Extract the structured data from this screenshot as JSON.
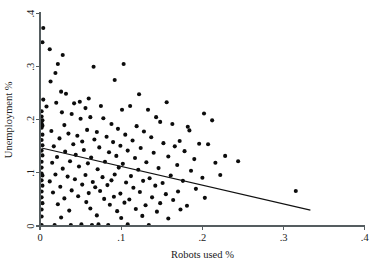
{
  "chart_data": {
    "type": "scatter",
    "title": "",
    "xlabel": "Robots used %",
    "ylabel": "Unemployment %",
    "xlim": [
      0,
      0.4
    ],
    "ylim": [
      0,
      0.4
    ],
    "xticks": [
      0,
      0.1,
      0.2,
      0.3,
      0.4
    ],
    "xticklabels": [
      "0",
      ".1",
      ".2",
      ".3",
      ".4"
    ],
    "yticks": [
      0,
      0.1,
      0.2,
      0.3,
      0.4
    ],
    "yticklabels": [
      "0",
      ".1",
      ".2",
      ".3",
      ".4"
    ],
    "grid": false,
    "legend": null,
    "marker": "filled-circle",
    "marker_color": "#0c0c0c",
    "fit_line": {
      "name": "linear fit",
      "color": "#111111",
      "x_start": 0.002,
      "y_start": 0.147,
      "x_end": 0.333,
      "y_end": 0.03
    },
    "points": [
      [
        0.004,
        0.373
      ],
      [
        0.003,
        0.346
      ],
      [
        0.012,
        0.333
      ],
      [
        0.028,
        0.322
      ],
      [
        0.022,
        0.305
      ],
      [
        0.019,
        0.288
      ],
      [
        0.066,
        0.3
      ],
      [
        0.103,
        0.305
      ],
      [
        0.013,
        0.272
      ],
      [
        0.092,
        0.275
      ],
      [
        0.026,
        0.253
      ],
      [
        0.032,
        0.249
      ],
      [
        0.122,
        0.248
      ],
      [
        0.004,
        0.238
      ],
      [
        0.049,
        0.234
      ],
      [
        0.06,
        0.24
      ],
      [
        0.02,
        0.232
      ],
      [
        0.042,
        0.231
      ],
      [
        0.111,
        0.226
      ],
      [
        0.156,
        0.233
      ],
      [
        0.008,
        0.225
      ],
      [
        0.056,
        0.222
      ],
      [
        0.075,
        0.226
      ],
      [
        0.101,
        0.219
      ],
      [
        0.133,
        0.219
      ],
      [
        0.002,
        0.216
      ],
      [
        0.027,
        0.214
      ],
      [
        0.039,
        0.211
      ],
      [
        0.002,
        0.206
      ],
      [
        0.003,
        0.199
      ],
      [
        0.05,
        0.202
      ],
      [
        0.062,
        0.205
      ],
      [
        0.078,
        0.203
      ],
      [
        0.143,
        0.205
      ],
      [
        0.002,
        0.193
      ],
      [
        0.003,
        0.189
      ],
      [
        0.002,
        0.185
      ],
      [
        0.03,
        0.19
      ],
      [
        0.088,
        0.192
      ],
      [
        0.119,
        0.188
      ],
      [
        0.148,
        0.196
      ],
      [
        0.163,
        0.192
      ],
      [
        0.014,
        0.179
      ],
      [
        0.058,
        0.181
      ],
      [
        0.07,
        0.177
      ],
      [
        0.096,
        0.183
      ],
      [
        0.128,
        0.178
      ],
      [
        0.182,
        0.187
      ],
      [
        0.184,
        0.18
      ],
      [
        0.003,
        0.172
      ],
      [
        0.035,
        0.174
      ],
      [
        0.046,
        0.17
      ],
      [
        0.082,
        0.168
      ],
      [
        0.105,
        0.172
      ],
      [
        0.137,
        0.167
      ],
      [
        0.202,
        0.212
      ],
      [
        0.212,
        0.199
      ],
      [
        0.002,
        0.162
      ],
      [
        0.024,
        0.165
      ],
      [
        0.052,
        0.159
      ],
      [
        0.067,
        0.163
      ],
      [
        0.09,
        0.158
      ],
      [
        0.114,
        0.161
      ],
      [
        0.152,
        0.156
      ],
      [
        0.172,
        0.16
      ],
      [
        0.003,
        0.152
      ],
      [
        0.017,
        0.15
      ],
      [
        0.041,
        0.154
      ],
      [
        0.073,
        0.148
      ],
      [
        0.099,
        0.151
      ],
      [
        0.124,
        0.147
      ],
      [
        0.166,
        0.15
      ],
      [
        0.196,
        0.155
      ],
      [
        0.207,
        0.154
      ],
      [
        0.002,
        0.142
      ],
      [
        0.031,
        0.14
      ],
      [
        0.054,
        0.143
      ],
      [
        0.085,
        0.139
      ],
      [
        0.108,
        0.142
      ],
      [
        0.14,
        0.138
      ],
      [
        0.178,
        0.141
      ],
      [
        0.003,
        0.133
      ],
      [
        0.021,
        0.13
      ],
      [
        0.044,
        0.134
      ],
      [
        0.063,
        0.129
      ],
      [
        0.094,
        0.132
      ],
      [
        0.117,
        0.128
      ],
      [
        0.158,
        0.131
      ],
      [
        0.19,
        0.126
      ],
      [
        0.228,
        0.132
      ],
      [
        0.002,
        0.121
      ],
      [
        0.015,
        0.119
      ],
      [
        0.037,
        0.122
      ],
      [
        0.059,
        0.118
      ],
      [
        0.08,
        0.121
      ],
      [
        0.102,
        0.117
      ],
      [
        0.131,
        0.12
      ],
      [
        0.169,
        0.115
      ],
      [
        0.216,
        0.119
      ],
      [
        0.244,
        0.122
      ],
      [
        0.002,
        0.11
      ],
      [
        0.028,
        0.108
      ],
      [
        0.048,
        0.112
      ],
      [
        0.071,
        0.107
      ],
      [
        0.097,
        0.11
      ],
      [
        0.121,
        0.106
      ],
      [
        0.146,
        0.109
      ],
      [
        0.186,
        0.104
      ],
      [
        0.002,
        0.099
      ],
      [
        0.003,
        0.095
      ],
      [
        0.019,
        0.097
      ],
      [
        0.034,
        0.093
      ],
      [
        0.056,
        0.096
      ],
      [
        0.077,
        0.092
      ],
      [
        0.092,
        0.097
      ],
      [
        0.112,
        0.094
      ],
      [
        0.135,
        0.09
      ],
      [
        0.161,
        0.095
      ],
      [
        0.2,
        0.091
      ],
      [
        0.222,
        0.096
      ],
      [
        0.002,
        0.086
      ],
      [
        0.012,
        0.084
      ],
      [
        0.043,
        0.088
      ],
      [
        0.065,
        0.083
      ],
      [
        0.088,
        0.086
      ],
      [
        0.106,
        0.082
      ],
      [
        0.127,
        0.085
      ],
      [
        0.151,
        0.081
      ],
      [
        0.176,
        0.085
      ],
      [
        0.003,
        0.076
      ],
      [
        0.025,
        0.074
      ],
      [
        0.052,
        0.078
      ],
      [
        0.068,
        0.073
      ],
      [
        0.083,
        0.077
      ],
      [
        0.115,
        0.072
      ],
      [
        0.142,
        0.076
      ],
      [
        0.192,
        0.07
      ],
      [
        0.002,
        0.065
      ],
      [
        0.016,
        0.063
      ],
      [
        0.039,
        0.067
      ],
      [
        0.06,
        0.062
      ],
      [
        0.074,
        0.066
      ],
      [
        0.099,
        0.061
      ],
      [
        0.123,
        0.064
      ],
      [
        0.155,
        0.06
      ],
      [
        0.17,
        0.065
      ],
      [
        0.002,
        0.054
      ],
      [
        0.03,
        0.052
      ],
      [
        0.047,
        0.056
      ],
      [
        0.079,
        0.051
      ],
      [
        0.091,
        0.055
      ],
      [
        0.11,
        0.05
      ],
      [
        0.138,
        0.054
      ],
      [
        0.164,
        0.049
      ],
      [
        0.203,
        0.053
      ],
      [
        0.003,
        0.043
      ],
      [
        0.022,
        0.041
      ],
      [
        0.057,
        0.045
      ],
      [
        0.086,
        0.04
      ],
      [
        0.104,
        0.044
      ],
      [
        0.13,
        0.039
      ],
      [
        0.148,
        0.043
      ],
      [
        0.181,
        0.038
      ],
      [
        0.002,
        0.031
      ],
      [
        0.036,
        0.029
      ],
      [
        0.062,
        0.033
      ],
      [
        0.095,
        0.028
      ],
      [
        0.118,
        0.032
      ],
      [
        0.144,
        0.027
      ],
      [
        0.173,
        0.031
      ],
      [
        0.002,
        0.018
      ],
      [
        0.026,
        0.016
      ],
      [
        0.07,
        0.02
      ],
      [
        0.1,
        0.015
      ],
      [
        0.126,
        0.019
      ],
      [
        0.158,
        0.014
      ],
      [
        0.002,
        0.002
      ],
      [
        0.018,
        0.002
      ],
      [
        0.038,
        0.002
      ],
      [
        0.051,
        0.003
      ],
      [
        0.064,
        0.002
      ],
      [
        0.072,
        0.003
      ],
      [
        0.084,
        0.002
      ],
      [
        0.108,
        0.003
      ],
      [
        0.134,
        0.002
      ],
      [
        0.315,
        0.066
      ]
    ]
  }
}
